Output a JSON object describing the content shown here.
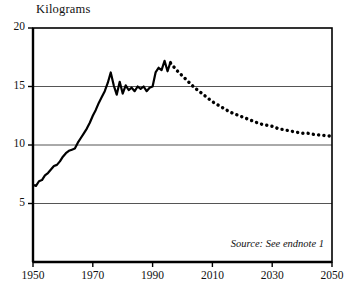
{
  "chart_data": {
    "type": "line",
    "title": "",
    "ylabel": "Kilograms",
    "xlabel": "",
    "ylim": [
      0,
      20
    ],
    "xlim": [
      1950,
      2050
    ],
    "grid": true,
    "legend_position": "none",
    "yticks": [
      "5",
      "10",
      "15",
      "20"
    ],
    "ytick_values": [
      5,
      10,
      15,
      20
    ],
    "xticks": [
      "1950",
      "1970",
      "1990",
      "2010",
      "2030",
      "2050"
    ],
    "xtick_values": [
      1950,
      1970,
      1990,
      2010,
      2030,
      2050
    ],
    "annotations": [
      {
        "text": "Source: See endnote 1",
        "style": "italic",
        "position": "bottom-right"
      }
    ],
    "series": [
      {
        "name": "historical",
        "style": "solid",
        "color": "#000000",
        "x": [
          1950,
          1951,
          1952,
          1953,
          1954,
          1955,
          1956,
          1957,
          1958,
          1959,
          1960,
          1961,
          1962,
          1963,
          1964,
          1965,
          1966,
          1967,
          1968,
          1969,
          1970,
          1971,
          1972,
          1973,
          1974,
          1975,
          1976,
          1977,
          1978,
          1979,
          1980,
          1981,
          1982,
          1983,
          1984,
          1985,
          1986,
          1987,
          1988,
          1989,
          1990,
          1991,
          1992,
          1993,
          1994,
          1995,
          1996
        ],
        "values": [
          6.6,
          6.5,
          6.9,
          7.0,
          7.4,
          7.6,
          7.9,
          8.2,
          8.3,
          8.6,
          9.0,
          9.3,
          9.5,
          9.6,
          9.7,
          10.2,
          10.6,
          11.0,
          11.4,
          11.9,
          12.5,
          13.0,
          13.6,
          14.1,
          14.6,
          15.3,
          16.2,
          15.1,
          14.3,
          15.4,
          14.4,
          15.1,
          14.7,
          14.9,
          14.6,
          15.0,
          14.8,
          15.0,
          14.6,
          14.9,
          15.0,
          16.2,
          16.6,
          16.4,
          17.2,
          16.3,
          17.1
        ]
      },
      {
        "name": "projection",
        "style": "dotted",
        "color": "#000000",
        "x": [
          1996,
          1998,
          2000,
          2002,
          2004,
          2006,
          2008,
          2010,
          2012,
          2014,
          2016,
          2018,
          2020,
          2022,
          2024,
          2026,
          2028,
          2030,
          2032,
          2034,
          2036,
          2038,
          2040,
          2042,
          2044,
          2046,
          2048,
          2050
        ],
        "values": [
          17.0,
          16.4,
          15.9,
          15.4,
          14.9,
          14.5,
          14.1,
          13.7,
          13.4,
          13.1,
          12.8,
          12.6,
          12.4,
          12.2,
          12.0,
          11.8,
          11.7,
          11.6,
          11.4,
          11.3,
          11.2,
          11.1,
          11.0,
          11.0,
          10.9,
          10.85,
          10.8,
          10.75
        ]
      }
    ]
  },
  "layout": {
    "plot_left": 33,
    "plot_right": 332,
    "plot_top": 28,
    "plot_bottom": 262
  }
}
